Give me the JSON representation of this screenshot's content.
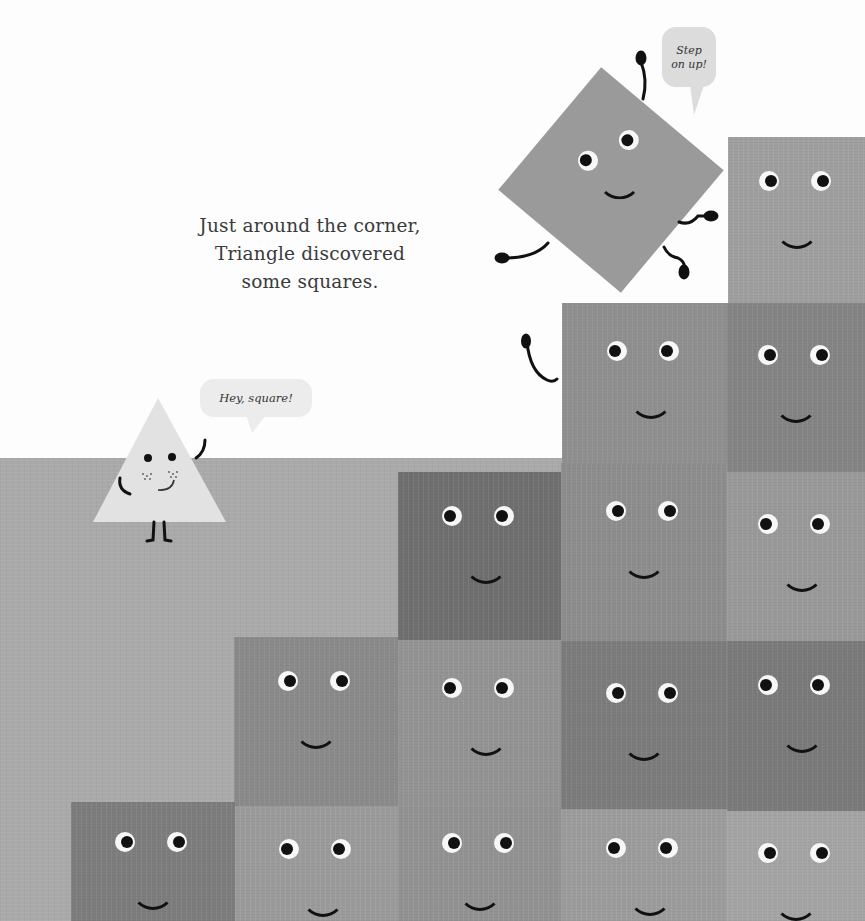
{
  "page": {
    "narration": {
      "lines": [
        "Just around the corner,",
        "Triangle discovered",
        "some squares."
      ]
    },
    "bubbles": {
      "triangle": "Hey, square!",
      "tilted_square": [
        "Step",
        "on up!"
      ]
    },
    "characters": {
      "triangle": {
        "name": "Triangle",
        "color": "#e2e2e2"
      },
      "tilted_square": {
        "name": "Square",
        "color": "#9a9a9a",
        "rotation_deg": 40
      }
    },
    "colors": {
      "sky": "#fdfdfd",
      "ground": "#a9a9a9",
      "text": "#3a3a3a",
      "bubble_light": "#ececec",
      "bubble_dark": "#dcdcdc"
    },
    "squares": [
      {
        "id": "r0c4",
        "x": 728,
        "y": 137,
        "w": 137,
        "h": 168,
        "color": "#9f9f9f"
      },
      {
        "id": "r1c3",
        "x": 562,
        "y": 303,
        "w": 165,
        "h": 170,
        "color": "#8f8f8f"
      },
      {
        "id": "r1c4",
        "x": 727,
        "y": 303,
        "w": 138,
        "h": 170,
        "color": "#848484"
      },
      {
        "id": "r2c2",
        "x": 398,
        "y": 472,
        "w": 163,
        "h": 170,
        "color": "#6f6f6f"
      },
      {
        "id": "r2c3",
        "x": 561,
        "y": 463,
        "w": 166,
        "h": 180,
        "color": "#8d8d8d"
      },
      {
        "id": "r2c4",
        "x": 727,
        "y": 472,
        "w": 138,
        "h": 170,
        "color": "#999999"
      },
      {
        "id": "r3c1",
        "x": 234,
        "y": 637,
        "w": 164,
        "h": 170,
        "color": "#8a8a8a"
      },
      {
        "id": "r3c2",
        "x": 398,
        "y": 640,
        "w": 163,
        "h": 168,
        "color": "#939393"
      },
      {
        "id": "r3c3",
        "x": 561,
        "y": 641,
        "w": 166,
        "h": 168,
        "color": "#7c7c7c"
      },
      {
        "id": "r3c4",
        "x": 727,
        "y": 641,
        "w": 138,
        "h": 170,
        "color": "#7a7a7a"
      },
      {
        "id": "r4c0",
        "x": 71,
        "y": 802,
        "w": 164,
        "h": 119,
        "color": "#7d7d7d"
      },
      {
        "id": "r4c1",
        "x": 235,
        "y": 806,
        "w": 163,
        "h": 115,
        "color": "#9b9b9b"
      },
      {
        "id": "r4c2",
        "x": 398,
        "y": 808,
        "w": 163,
        "h": 113,
        "color": "#929292"
      },
      {
        "id": "r4c3",
        "x": 561,
        "y": 809,
        "w": 166,
        "h": 112,
        "color": "#9c9c9c"
      },
      {
        "id": "r4c4",
        "x": 727,
        "y": 811,
        "w": 138,
        "h": 110,
        "color": "#a4a4a4"
      }
    ]
  }
}
